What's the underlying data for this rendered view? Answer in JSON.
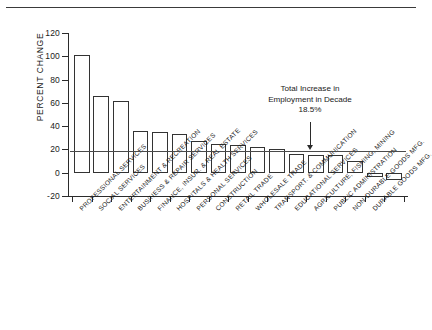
{
  "chart_data": {
    "type": "bar",
    "title": "",
    "subtitle": "",
    "xlabel": "",
    "ylabel": "PERCENT CHANGE",
    "ylim": [
      -20,
      120
    ],
    "yticks": [
      -20,
      0,
      20,
      40,
      60,
      80,
      100,
      120
    ],
    "ytick_labels": [
      "-20",
      "0",
      "20",
      "40",
      "60",
      "80",
      "100",
      "120"
    ],
    "grid": false,
    "legend": "none",
    "categories": [
      "PROFESSIONAL SERVICES",
      "SOCIAL SERVICES",
      "ENTERTAINMENT & RECREATION",
      "BUSINESS & REPAIR SERVICES",
      "FINANCE, INSUR. & REAL ESTATE",
      "HOSPITALS & HEALTH SERVICES",
      "PERSONAL SERVICES",
      "CONSTRUCTION",
      "RETAIL TRADE",
      "WHOLESALE TRADE",
      "TRANSPORT. & COMMUNICATION",
      "EDUCATIONAL SERVICES",
      "AGRICULTURE, FISHING, MINING",
      "PUBLIC ADMINISTRATION",
      "NON-DURABLE GOODS MFG.",
      "DURABLE GOODS MFG."
    ],
    "values": [
      101,
      66,
      62,
      36,
      35,
      33,
      27,
      25,
      24,
      22,
      20,
      16,
      15,
      15,
      10,
      -4
    ],
    "extra_values": [
      -6
    ],
    "reference_line": {
      "value": 18.5,
      "label_lines": [
        "Total Increase in",
        "Employment in Decade",
        "18.5%"
      ]
    },
    "colors": {
      "bar_fill": "#ffffff",
      "bar_edge": "#333333",
      "axis": "#2b2b2b",
      "reference_line": "#4a4a4a",
      "text": "#1a1a1a"
    }
  }
}
